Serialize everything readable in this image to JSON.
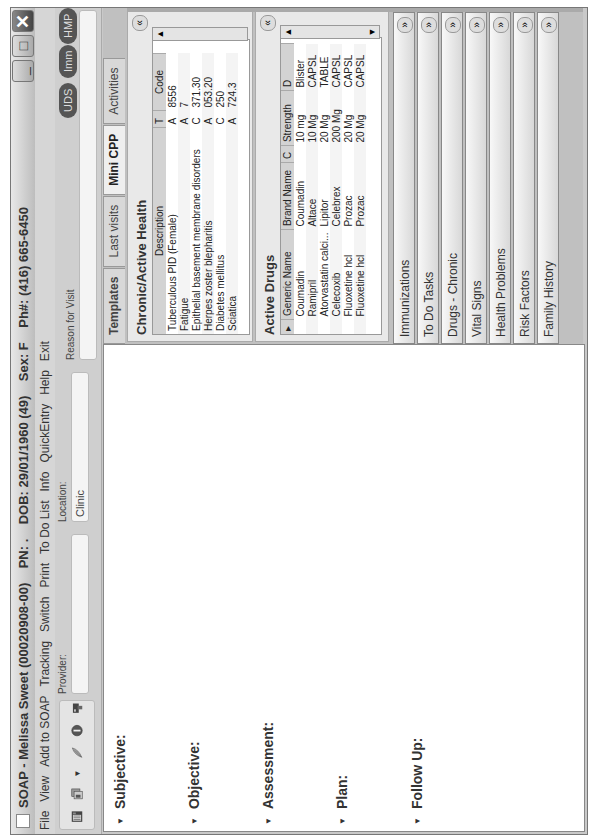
{
  "window": {
    "title": "SOAP - Melissa Sweet (00020908-00)    PN: .    DOB: 29/01/1960 (49)    Sex: F    Ph#: (416) 665-6450",
    "minimize_label": "_",
    "maximize_label": "□",
    "close_label": "✕"
  },
  "menu": [
    "File",
    "View",
    "Add to SOAP",
    "Tracking",
    "Switch",
    "Print",
    "To Do List",
    "Info",
    "QuickEntry",
    "Help",
    "Exit"
  ],
  "toolbar": {
    "icons": [
      "notes-icon",
      "documents-icon",
      "feather-icon",
      "info-icon",
      "printer-icon"
    ],
    "provider_label": "Provider:",
    "provider_value": "",
    "location_label": "Location:",
    "location_value": "Clinic",
    "reason_label": "Reason for Visit",
    "reason_value": "",
    "pills": [
      "UDS",
      "Imm",
      "HMP"
    ]
  },
  "soap": {
    "sections": [
      "Subjective:",
      "Objective:",
      "Assessment:",
      "Plan:",
      "Follow Up:"
    ]
  },
  "right_panel": {
    "tabs": [
      "Templates",
      "Last visits",
      "Mini CPP",
      "Activities"
    ],
    "selected_tab": "Mini CPP",
    "chronic": {
      "title": "Chronic/Active Health",
      "columns": [
        "Description",
        "T",
        "Code"
      ],
      "rows": [
        [
          "Tuberculous PID (Female)",
          "A",
          "8556"
        ],
        [
          "Fatigue",
          "A",
          "7"
        ],
        [
          "Epithelial basement membrane disorders",
          "C",
          "371.30"
        ],
        [
          "Herpes zoster blepharitis",
          "A",
          "053.20"
        ],
        [
          "Diabetes mellitus",
          "C",
          "250"
        ],
        [
          "Sciatica",
          "A",
          "724.3"
        ]
      ]
    },
    "drugs": {
      "title": "Active Drugs",
      "columns": [
        "Generic Name",
        "Brand Name",
        "C",
        "Strength",
        "D"
      ],
      "rows": [
        [
          "Coumadin",
          "Coumadin",
          "",
          "10 mg",
          "Blister"
        ],
        [
          "Ramipril",
          "Altace",
          "",
          "10 Mg",
          "CAPSL"
        ],
        [
          "Atorvastatin calci...",
          "Lipitor",
          "",
          "20 Mg",
          "TABLE"
        ],
        [
          "Celecoxib",
          "Celebrex",
          "",
          "200 Mg",
          "CAPSL"
        ],
        [
          "Fluoxetine hcl",
          "Prozac",
          "",
          "20 Mg",
          "CAPSL"
        ],
        [
          "Fluoxetine hcl",
          "Prozac",
          "",
          "20 Mg",
          "CAPSL"
        ]
      ]
    },
    "collapsed_panels": [
      "Immunizations",
      "To Do Tasks",
      "Drugs - Chronic",
      "Vital Signs",
      "Health Problems",
      "Risk Factors",
      "Family History"
    ]
  }
}
